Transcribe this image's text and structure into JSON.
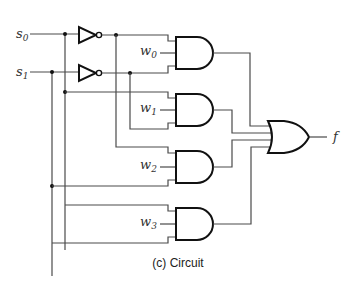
{
  "figure": {
    "caption": "(c) Circuit",
    "inputs": [
      {
        "name": "s",
        "sub": "0"
      },
      {
        "name": "s",
        "sub": "1"
      }
    ],
    "data_inputs": [
      {
        "name": "w",
        "sub": "0"
      },
      {
        "name": "w",
        "sub": "1"
      },
      {
        "name": "w",
        "sub": "2"
      },
      {
        "name": "w",
        "sub": "3"
      }
    ],
    "output": {
      "name": "f"
    },
    "gates": [
      "NOT",
      "NOT",
      "AND",
      "AND",
      "AND",
      "AND",
      "OR"
    ],
    "colors": {
      "wire": "#4a4a4a",
      "gate_stroke": "#111111",
      "background": "#ffffff"
    }
  }
}
